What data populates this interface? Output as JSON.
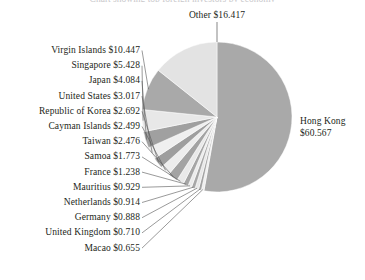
{
  "chart_data": {
    "type": "pie",
    "title": "",
    "title_clipped": "Chart showing top foreign investors by economy",
    "unit": "USD billions",
    "value_prefix": "$",
    "categories": [
      "Hong Kong",
      "Other",
      "Virgin Islands",
      "Singapore",
      "Japan",
      "United States",
      "Republic of Korea",
      "Cayman Islands",
      "Taiwan",
      "Samoa",
      "France",
      "Mauritius",
      "Netherlands",
      "Germany",
      "United Kingdom",
      "Macao"
    ],
    "values": [
      60.567,
      16.417,
      10.447,
      5.428,
      4.084,
      3.017,
      2.692,
      2.499,
      2.476,
      1.773,
      1.238,
      0.929,
      0.914,
      0.888,
      0.71,
      0.655
    ],
    "labels": [
      "Hong Kong $60.567",
      "Other $16.417",
      "Virgin Islands $10.447",
      "Singapore $5.428",
      "Japan $4.084",
      "United States $3.017",
      "Republic of Korea $2.692",
      "Cayman Islands $2.499",
      "Taiwan $2.476",
      "Samoa $1.773",
      "France $1.238",
      "Mauritius $0.929",
      "Netherlands $0.914",
      "Germany $0.888",
      "United Kingdom $0.710",
      "Macao $0.655"
    ],
    "colors": [
      "#a9a9a9",
      "#e3e3e3",
      "#a9a9a9",
      "#e8e8e8",
      "#a0a0a0",
      "#efefef",
      "#9e9e9e",
      "#ededed",
      "#a3a3a3",
      "#e9e9e9",
      "#a5a5a5",
      "#ebebeb",
      "#a7a7a7",
      "#e7e7e7",
      "#a2a2a2",
      "#eeeeee"
    ],
    "legend": "none",
    "grid": false,
    "start_angle_deg": 0,
    "direction": "clockwise"
  },
  "pie": {
    "hong_kong_name": "Hong Kong",
    "hong_kong_value": "$60.567",
    "other_label": "Other $16.417"
  },
  "left_labels": [
    "Virgin Islands $10.447",
    "Singapore $5.428",
    "Japan $4.084",
    "United States $3.017",
    "Republic of Korea $2.692",
    "Cayman Islands $2.499",
    "Taiwan $2.476",
    "Samoa $1.773",
    "France $1.238",
    "Mauritius $0.929",
    "Netherlands $0.914",
    "Germany $0.888",
    "United Kingdom $0.710",
    "Macao $0.655"
  ]
}
